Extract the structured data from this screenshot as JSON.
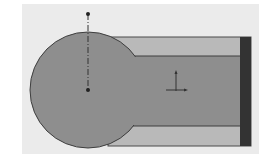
{
  "drawing": {
    "background": "#ffffff",
    "panel": {
      "x": 22,
      "y": 4,
      "w": 237,
      "h": 150,
      "fill": "#ebebeb"
    },
    "outer_rect": {
      "x": 108,
      "y": 37,
      "w": 143,
      "h": 109,
      "fill": "#b9b9b9",
      "stroke": "#4a4a4a"
    },
    "inner_rect": {
      "x": 118,
      "y": 56,
      "w": 124,
      "h": 70,
      "fill": "#8e8e8e",
      "stroke": "#3e3e3e"
    },
    "end_bar": {
      "x": 240,
      "y": 37,
      "w": 11,
      "h": 109,
      "fill": "#333333"
    },
    "circle": {
      "cx": 88,
      "cy": 90,
      "r": 58,
      "fill": "#8e8e8e",
      "stroke": "#3e3e3e"
    },
    "centerline": {
      "x": 88,
      "y1": 14,
      "y2": 90,
      "color": "#333333"
    },
    "center_points": [
      {
        "name": "top-point",
        "x": 88,
        "y": 14
      },
      {
        "name": "circle-center-point",
        "x": 88,
        "y": 90
      }
    ],
    "origin_marker": {
      "x": 176,
      "y": 90,
      "color": "#333333"
    }
  }
}
